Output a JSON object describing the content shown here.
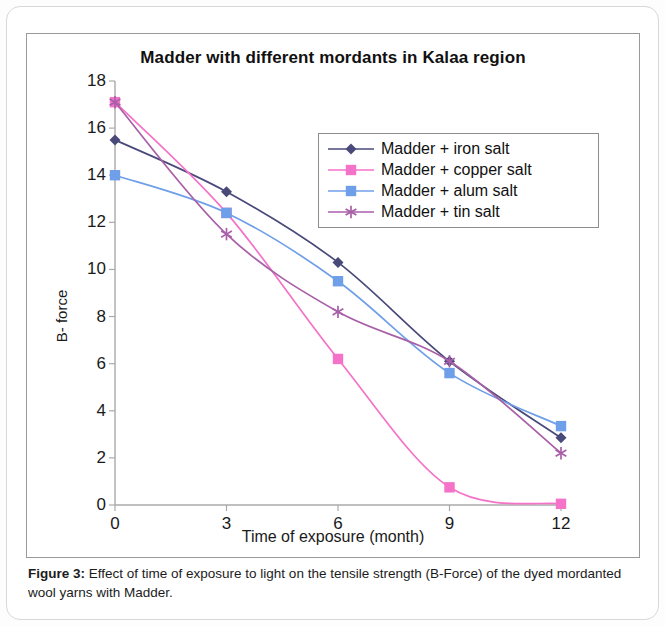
{
  "figure": {
    "caption_label": "Figure 3:",
    "caption_text": " Effect of time of exposure to light on the tensile strength (B-Force) of the dyed mordanted wool yarns with Madder."
  },
  "chart_data": {
    "type": "line",
    "title": "Madder with different mordants in Kalaa region",
    "xlabel": "Time of exposure (month)",
    "ylabel": "B- force",
    "x": [
      0,
      3,
      6,
      9,
      12
    ],
    "xtick_labels": [
      "0",
      "3",
      "6",
      "9",
      "12"
    ],
    "ytick_labels": [
      "0",
      "2",
      "4",
      "6",
      "8",
      "10",
      "12",
      "14",
      "16",
      "18"
    ],
    "ytick_values": [
      0,
      2,
      4,
      6,
      8,
      10,
      12,
      14,
      16,
      18
    ],
    "xlim": [
      0,
      12
    ],
    "ylim": [
      0,
      18
    ],
    "grid": false,
    "legend_position": "upper-right-inside",
    "series": [
      {
        "name": "Madder + iron salt",
        "color": "#4a4a7a",
        "marker": "diamond",
        "values": [
          15.5,
          13.3,
          10.3,
          6.1,
          2.85
        ]
      },
      {
        "name": "Madder + copper salt",
        "color": "#f472c8",
        "marker": "square",
        "values": [
          17.1,
          12.4,
          6.2,
          0.75,
          0.05
        ]
      },
      {
        "name": "Madder + alum salt",
        "color": "#6f9fe8",
        "marker": "square",
        "values": [
          14.0,
          12.4,
          9.5,
          5.6,
          3.35
        ]
      },
      {
        "name": "Madder + tin salt",
        "color": "#a85fa8",
        "marker": "asterisk",
        "values": [
          17.1,
          11.5,
          8.2,
          6.1,
          2.2
        ]
      }
    ]
  }
}
